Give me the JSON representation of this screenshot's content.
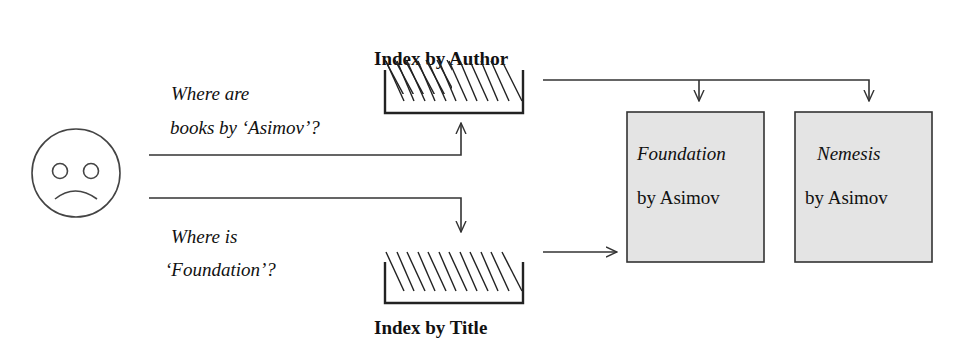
{
  "diagram": {
    "user": {
      "icon": "sad-face-icon"
    },
    "indexes": [
      {
        "label": "Index by Author",
        "icon": "index-tray-icon"
      },
      {
        "label": "Index by Title",
        "icon": "index-tray-icon"
      }
    ],
    "queries": [
      {
        "line1": "Where are",
        "line2": "books by ‘Asimov’?"
      },
      {
        "line1": "Where is",
        "line2": "‘Foundation’?"
      }
    ],
    "books": [
      {
        "title": "Foundation",
        "author": "by Asimov"
      },
      {
        "title": "Nemesis",
        "author": "by Asimov"
      }
    ],
    "colors": {
      "book_fill": "#e4e4e4",
      "line": "#333333",
      "background": "#ffffff"
    }
  }
}
